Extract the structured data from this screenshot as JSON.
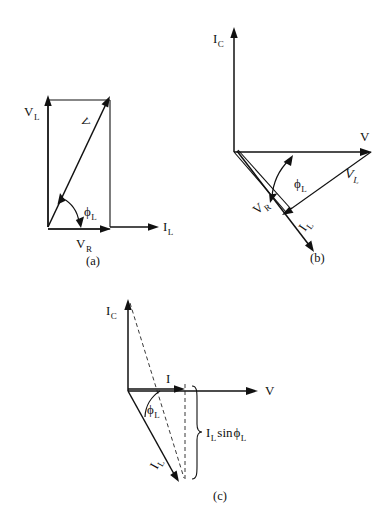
{
  "figure": {
    "background_color": "#ffffff",
    "ink_color": "#111111"
  },
  "diagram_a": {
    "caption": "(a)",
    "labels": {
      "v_l": "V",
      "v_l_sub": "L",
      "v_r": "V",
      "v_r_sub": "R",
      "i_l": "I",
      "i_l_sub": "L",
      "phi": "ϕ",
      "phi_sub": "L",
      "resultant": "V"
    }
  },
  "diagram_b": {
    "caption": "(b)",
    "labels": {
      "i_c": "I",
      "i_c_sub": "C",
      "v": "V",
      "v_l": "V",
      "v_l_sub": "L",
      "v_r": "V",
      "v_r_sub": "R",
      "i_l": "I",
      "i_l_sub": "L",
      "phi": "ϕ",
      "phi_sub": "L"
    }
  },
  "diagram_c": {
    "caption": "(c)",
    "labels": {
      "i_c": "I",
      "i_c_sub": "C",
      "v": "V",
      "i": "I",
      "i_l": "I",
      "i_l_sub": "L",
      "phi": "ϕ",
      "phi_sub": "L",
      "brace_main": "I",
      "brace_sub1": "L",
      "brace_sin": "sin",
      "brace_phi": "ϕ",
      "brace_sub2": "L"
    }
  }
}
